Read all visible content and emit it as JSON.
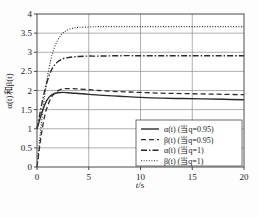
{
  "chart_data": {
    "type": "line",
    "title": "",
    "xlabel": "t/s",
    "ylabel": "α(t)和β(t)",
    "xlim": [
      0,
      20
    ],
    "ylim": [
      0,
      4
    ],
    "xticks": [
      "0",
      "5",
      "10",
      "15",
      "20"
    ],
    "yticks": [
      "0",
      "0.5",
      "1",
      "1.5",
      "2",
      "2.5",
      "3",
      "3.5",
      "4"
    ],
    "grid": true,
    "legend_position": "lower-right",
    "series": [
      {
        "name": "α(t) (当q=0.95)",
        "style": "solid",
        "color": "#2b2b2b",
        "x": [
          0,
          0.2,
          0.4,
          0.6,
          0.8,
          1.0,
          1.3,
          1.6,
          2.0,
          2.5,
          3.0,
          3.5,
          4.0,
          5.0,
          6.0,
          8.0,
          10.0,
          12.0,
          14.0,
          16.0,
          18.0,
          20.0
        ],
        "y": [
          1.0,
          1.18,
          1.36,
          1.52,
          1.66,
          1.76,
          1.86,
          1.91,
          1.94,
          1.95,
          1.94,
          1.93,
          1.92,
          1.9,
          1.88,
          1.85,
          1.82,
          1.8,
          1.79,
          1.78,
          1.77,
          1.76
        ]
      },
      {
        "name": "β(t) (当q=0.95)",
        "style": "dashed",
        "color": "#2b2b2b",
        "x": [
          0,
          0.2,
          0.4,
          0.6,
          0.8,
          1.0,
          1.3,
          1.6,
          2.0,
          2.5,
          3.0,
          3.5,
          4.0,
          5.0,
          6.0,
          8.0,
          10.0,
          12.0,
          14.0,
          16.0,
          18.0,
          20.0
        ],
        "y": [
          0.0,
          0.42,
          0.82,
          1.14,
          1.4,
          1.58,
          1.78,
          1.9,
          1.99,
          2.04,
          2.05,
          2.05,
          2.04,
          2.02,
          2.0,
          1.97,
          1.95,
          1.93,
          1.92,
          1.91,
          1.9,
          1.89
        ]
      },
      {
        "name": "α(t) (当q=1)",
        "style": "dashdot",
        "color": "#2b2b2b",
        "x": [
          0,
          0.2,
          0.4,
          0.6,
          0.8,
          1.0,
          1.3,
          1.6,
          2.0,
          2.5,
          3.0,
          3.5,
          4.0,
          5.0,
          6.0,
          8.0,
          10.0,
          12.0,
          14.0,
          16.0,
          18.0,
          20.0
        ],
        "y": [
          1.0,
          1.28,
          1.56,
          1.82,
          2.05,
          2.25,
          2.48,
          2.63,
          2.75,
          2.83,
          2.86,
          2.88,
          2.89,
          2.9,
          2.9,
          2.91,
          2.91,
          2.91,
          2.91,
          2.91,
          2.91,
          2.91
        ]
      },
      {
        "name": "β(t) (当q=1)",
        "style": "dotted",
        "color": "#2b2b2b",
        "x": [
          0,
          0.2,
          0.4,
          0.6,
          0.8,
          1.0,
          1.3,
          1.6,
          2.0,
          2.5,
          3.0,
          3.5,
          4.0,
          5.0,
          6.0,
          8.0,
          10.0,
          12.0,
          14.0,
          16.0,
          18.0,
          20.0
        ],
        "y": [
          0.0,
          0.55,
          1.08,
          1.56,
          1.98,
          2.34,
          2.76,
          3.06,
          3.32,
          3.5,
          3.59,
          3.63,
          3.65,
          3.66,
          3.67,
          3.67,
          3.67,
          3.67,
          3.67,
          3.67,
          3.67,
          3.67
        ]
      }
    ]
  },
  "axis": {
    "x_label_main": "t",
    "x_label_sub": "/s",
    "y_label_full": "α(t)和β(t)"
  },
  "legend": {
    "entries": [
      {
        "label": "α(t) (当q=0.95)",
        "style": "solid"
      },
      {
        "label": "β(t) (当q=0.95)",
        "style": "dashed"
      },
      {
        "label": "α(t) (当q=1)",
        "style": "dashdot"
      },
      {
        "label": "β(t) (当q=1)",
        "style": "dotted"
      }
    ]
  }
}
